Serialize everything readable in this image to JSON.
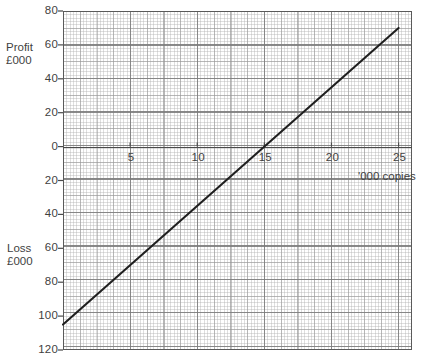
{
  "chart_data": {
    "type": "line",
    "title": "",
    "subtitle": "",
    "xlabel": "'000 copies",
    "ylabel_positive": "Profit £000",
    "ylabel_negative": "Loss £000",
    "x": [
      0,
      25
    ],
    "y": [
      -105,
      70
    ],
    "series": [
      {
        "name": "Profit / Loss",
        "x": [
          0,
          25
        ],
        "values": [
          -105,
          70
        ],
        "color": "#1f1f1f",
        "breakeven_x": 15
      }
    ],
    "xlim": [
      0,
      26
    ],
    "ylim": [
      -120,
      80
    ],
    "xticks": [
      5,
      10,
      15,
      20,
      25
    ],
    "xtick_labels": [
      "5",
      "10",
      "15",
      "20",
      "25"
    ],
    "yticks": [
      80,
      60,
      40,
      20,
      0,
      -20,
      -40,
      -60,
      -80,
      -100,
      -120
    ],
    "ytick_labels": [
      "80",
      "60",
      "40",
      "20",
      "0",
      "20",
      "40",
      "60",
      "80",
      "100",
      "120"
    ],
    "grid": true,
    "grid_style": "graph-paper",
    "legend": "none",
    "annotations": []
  },
  "axis_captions": {
    "profit_line1": "Profit",
    "profit_line2": "£000",
    "loss_line1": "Loss",
    "loss_line2": "£000",
    "x_caption": "'000 copies"
  },
  "colors": {
    "line": "#1f1f1f",
    "axis": "#4a4a4a",
    "frame": "#5a5a5a",
    "grid_major": "#787878",
    "grid_medium": "#969696",
    "grid_fine": "#afafaf",
    "text": "#3f3f3f",
    "background": "#ffffff"
  }
}
